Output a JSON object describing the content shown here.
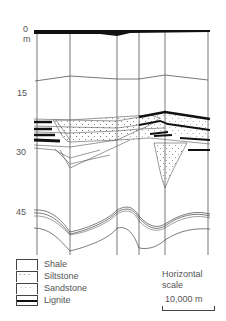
{
  "diagram": {
    "type": "geologic-cross-section",
    "depth_axis": {
      "unit": "m",
      "ticks": [
        {
          "label": "0",
          "y": 31
        },
        {
          "label": "15",
          "y": 93
        },
        {
          "label": "30",
          "y": 152
        },
        {
          "label": "45",
          "y": 211
        }
      ],
      "unit_label": "m"
    },
    "well_count": 6,
    "well_x": [
      37,
      70,
      117,
      139,
      165,
      208
    ]
  },
  "legend": {
    "items": [
      {
        "label": "Shale",
        "pattern": "blank"
      },
      {
        "label": "Siltstone",
        "pattern": "dashes"
      },
      {
        "label": "Sandstone",
        "pattern": "dots"
      },
      {
        "label": "Lignite",
        "pattern": "solid-black"
      }
    ]
  },
  "scale": {
    "title_line1": "Horizontal",
    "title_line2": "scale",
    "value": "10,000 m"
  }
}
